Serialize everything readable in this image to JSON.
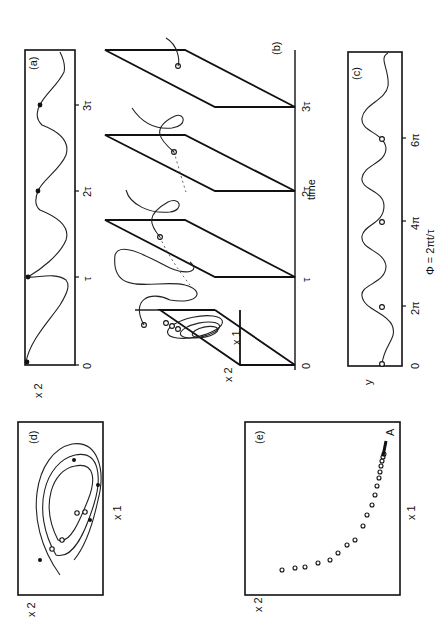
{
  "figure": {
    "orientation": "rotated 90 degrees clockwise",
    "panels": {
      "a": {
        "label": "(a)",
        "ylabel": "x 2",
        "xticks": [
          "0",
          "τ",
          "2τ",
          "3τ"
        ]
      },
      "b": {
        "label": "(b)",
        "xlabel": "time",
        "plane_axis_x": "x 1",
        "plane_axis_y": "x 2",
        "xticks": [
          "0",
          "τ",
          "2τ",
          "3τ"
        ]
      },
      "c": {
        "label": "(c)",
        "ylabel": "y",
        "xlabel": "Φ = 2πt/τ",
        "xticks": [
          "0",
          "2π",
          "4π",
          "6π"
        ]
      },
      "d": {
        "label": "(d)",
        "xlabel": "x 1",
        "ylabel": "x 2"
      },
      "e": {
        "label": "(e)",
        "xlabel": "x 1",
        "ylabel": "x 2",
        "point_label": "A"
      }
    }
  }
}
